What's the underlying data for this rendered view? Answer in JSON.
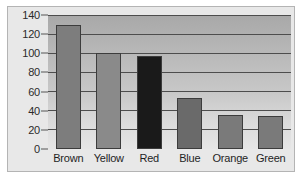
{
  "chart_data": {
    "type": "bar",
    "title": "",
    "xlabel": "",
    "ylabel": "",
    "categories": [
      "Brown",
      "Yellow",
      "Red",
      "Blue",
      "Orange",
      "Green"
    ],
    "values": [
      130,
      100,
      97,
      53,
      36,
      34
    ],
    "bar_colors": [
      "#7d7d7d",
      "#8a8a8a",
      "#1a1a1a",
      "#6a6a6a",
      "#7a7a7a",
      "#7a7a7a"
    ],
    "ylim": [
      0,
      140
    ],
    "ytick_labels": [
      "0",
      "20",
      "40",
      "60",
      "80",
      "100",
      "120",
      "140"
    ],
    "ytick_values": [
      0,
      20,
      40,
      60,
      80,
      100,
      120,
      140
    ],
    "grid": true,
    "legend": false,
    "plot_background": "#c0c0c0",
    "frame_border_color": "#b4b4b4",
    "page_background": "#e8e8e8"
  }
}
